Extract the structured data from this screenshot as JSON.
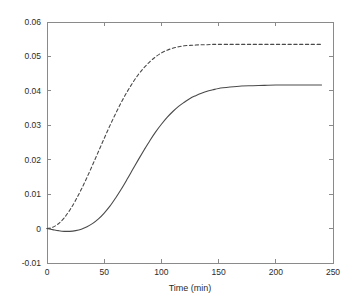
{
  "chart_data": {
    "type": "line",
    "title": "",
    "xlabel": "Time (min)",
    "ylabel": "",
    "xlim": [
      0,
      250
    ],
    "ylim": [
      -0.01,
      0.06
    ],
    "grid": false,
    "legend": "none",
    "xticks": [
      0,
      50,
      100,
      150,
      200,
      250
    ],
    "xtick_labels": [
      "0",
      "50",
      "100",
      "150",
      "200",
      "250"
    ],
    "yticks": [
      -0.01,
      0,
      0.01,
      0.02,
      0.03,
      0.04,
      0.05,
      0.06
    ],
    "ytick_labels": [
      "-0.01",
      "0",
      "0.01",
      "0.02",
      "0.03",
      "0.04",
      "0.05",
      "0.06"
    ],
    "line_color": "#4a4a4a",
    "axis_color": "#8a8a8a",
    "background": "#ffffff",
    "series": [
      {
        "name": "dashed-curve",
        "style": "dashed",
        "plateau": 0.0535,
        "x": [
          0,
          5,
          10,
          15,
          20,
          25,
          30,
          35,
          40,
          45,
          50,
          55,
          60,
          65,
          70,
          75,
          80,
          85,
          90,
          95,
          100,
          105,
          110,
          115,
          120,
          125,
          130,
          135,
          140,
          145,
          150,
          160,
          170,
          180,
          190,
          200,
          210,
          220,
          230,
          240
        ],
        "values": [
          0.0,
          0.0004,
          0.0014,
          0.0031,
          0.0054,
          0.0082,
          0.0114,
          0.0149,
          0.0186,
          0.0224,
          0.0262,
          0.0299,
          0.0334,
          0.0367,
          0.0397,
          0.0424,
          0.0448,
          0.0468,
          0.0485,
          0.0499,
          0.051,
          0.0518,
          0.0524,
          0.0528,
          0.0531,
          0.0532,
          0.0533,
          0.0534,
          0.0534,
          0.0535,
          0.0535,
          0.0535,
          0.0535,
          0.0535,
          0.0535,
          0.0535,
          0.0535,
          0.0535,
          0.0535,
          0.0535
        ]
      },
      {
        "name": "solid-curve",
        "style": "solid",
        "plateau": 0.0417,
        "dip_min": -0.0008,
        "dip_at": 18,
        "x": [
          0,
          5,
          10,
          15,
          20,
          25,
          30,
          35,
          40,
          45,
          50,
          55,
          60,
          65,
          70,
          75,
          80,
          85,
          90,
          95,
          100,
          105,
          110,
          115,
          120,
          125,
          130,
          135,
          140,
          145,
          150,
          160,
          170,
          180,
          190,
          200,
          210,
          220,
          230,
          240
        ],
        "values": [
          0.0,
          -0.0003,
          -0.0006,
          -0.0008,
          -0.0008,
          -0.0006,
          -0.0002,
          0.0005,
          0.0015,
          0.0028,
          0.0045,
          0.0065,
          0.0089,
          0.0115,
          0.0143,
          0.0172,
          0.0201,
          0.0229,
          0.0256,
          0.0281,
          0.0303,
          0.0323,
          0.034,
          0.0355,
          0.0367,
          0.0378,
          0.0386,
          0.0393,
          0.0399,
          0.0403,
          0.0407,
          0.0411,
          0.0414,
          0.0415,
          0.0416,
          0.0417,
          0.0417,
          0.0417,
          0.0417,
          0.0417
        ]
      }
    ]
  }
}
